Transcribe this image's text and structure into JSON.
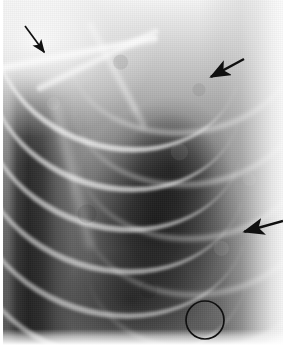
{
  "figure": {
    "kind": "medical-radiograph",
    "modality": "X-ray",
    "body_region": "chest",
    "view": "frontal / PA",
    "side_shown": "left hemithorax",
    "color_mode": "grayscale",
    "width_px": 283,
    "height_px": 353,
    "caption": "",
    "label": ""
  },
  "image_regions": [
    {
      "name": "shoulder-soft-tissue",
      "description": "bright shoulder and humeral head, upper left"
    },
    {
      "name": "clavicle-band",
      "description": "bright oblique clavicle / first rib band crossing the upper left"
    },
    {
      "name": "mediastinal-border",
      "description": "dark vertical column along the far left margin"
    },
    {
      "name": "lung-field",
      "description": "dark central and lower lung field with air lucency"
    },
    {
      "name": "rib-cage",
      "description": "bright arcing posterior and lateral ribs sweeping down and to the right"
    },
    {
      "name": "lateral-chest-wall",
      "description": "bright soft tissue band along the right margin"
    }
  ],
  "annotations": {
    "stroke_color": "#101010",
    "items": [
      {
        "id": "arrow-1",
        "type": "arrow",
        "label": "",
        "direction": "down-right",
        "tail": {
          "x": 25,
          "y": 26
        },
        "tip": {
          "x": 47,
          "y": 56
        },
        "points_at": "clavicle-band"
      },
      {
        "id": "arrow-2",
        "type": "arrow",
        "label": "",
        "direction": "down-left",
        "tail": {
          "x": 244,
          "y": 59
        },
        "tip": {
          "x": 207,
          "y": 79
        },
        "points_at": "upper-lateral-rib"
      },
      {
        "id": "arrow-3",
        "type": "arrow",
        "label": "",
        "direction": "left",
        "tail": {
          "x": 283,
          "y": 221
        },
        "tip": {
          "x": 240,
          "y": 233
        },
        "points_at": "lateral-chest-wall"
      },
      {
        "id": "circle-1",
        "type": "circle",
        "label": "",
        "center": {
          "x": 205,
          "y": 320
        },
        "radius": 19,
        "points_at": "lower-lung-zone"
      }
    ]
  }
}
